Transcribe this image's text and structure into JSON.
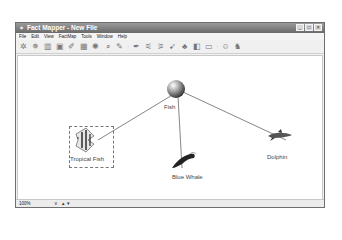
{
  "window": {
    "title": "Fact Mapper - New File",
    "buttons": {
      "minimize": "_",
      "maximize": "□",
      "close": "✕"
    }
  },
  "menubar": {
    "items": [
      {
        "label": "File"
      },
      {
        "label": "Edit"
      },
      {
        "label": "View"
      },
      {
        "label": "FactMap"
      },
      {
        "label": "Tools"
      },
      {
        "label": "Window"
      },
      {
        "label": "Help"
      }
    ]
  },
  "toolbar": {
    "icons": [
      {
        "name": "new-node-icon",
        "glyph": "✲"
      },
      {
        "name": "cluster-icon",
        "glyph": "✵"
      },
      {
        "name": "chart-icon",
        "glyph": "▥"
      },
      {
        "name": "image-icon",
        "glyph": "▣"
      },
      {
        "name": "paint-icon",
        "glyph": "✐"
      },
      {
        "name": "grid-icon",
        "glyph": "▦"
      },
      {
        "name": "settings-icon",
        "glyph": "✺"
      },
      {
        "name": "search-icon",
        "glyph": "⌕"
      },
      {
        "name": "pen-icon",
        "glyph": "✎"
      },
      {
        "name": "dropdown-1",
        "glyph": "·"
      },
      {
        "name": "brush-icon",
        "glyph": "✒"
      },
      {
        "name": "connect-icon",
        "glyph": "⚟"
      },
      {
        "name": "disconnect-icon",
        "glyph": "⚞"
      },
      {
        "name": "arrow-icon",
        "glyph": "➹"
      },
      {
        "name": "people-icon",
        "glyph": "♣"
      },
      {
        "name": "book-icon",
        "glyph": "◧"
      },
      {
        "name": "monitor-icon",
        "glyph": "▭"
      },
      {
        "name": "dropdown-2",
        "glyph": "·"
      },
      {
        "name": "help-icon",
        "glyph": "☺"
      },
      {
        "name": "users-icon",
        "glyph": "♞"
      }
    ]
  },
  "canvas": {
    "root": {
      "label": "Fish",
      "cx": 158,
      "cy": 33,
      "r": 9
    },
    "nodes": [
      {
        "id": "tropical-fish",
        "label": "Tropical Fish",
        "x": 72,
        "y": 92,
        "selected": true
      },
      {
        "id": "blue-whale",
        "label": "Blue Whale",
        "x": 166,
        "y": 103
      },
      {
        "id": "dolphin",
        "label": "Dolphin",
        "x": 260,
        "y": 80
      }
    ]
  },
  "statusbar": {
    "zoom": "100%",
    "dropdown": "∨",
    "up": "▲",
    "down": "▼"
  }
}
